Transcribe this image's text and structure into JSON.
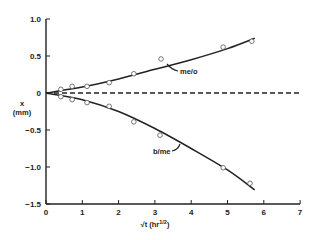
{
  "chart_data": {
    "type": "scatter",
    "title": "",
    "xlabel": "√t (hr^1/2)",
    "xlabel_main": "√t",
    "xlabel_unit": "(hr",
    "xlabel_exp": "1/2",
    "xlabel_close": ")",
    "ylabel": "x (mm)",
    "ylabel_var": "x",
    "ylabel_unit": "(mm)",
    "xlim": [
      0,
      7
    ],
    "ylim": [
      -1.5,
      1.0
    ],
    "x_ticks": [
      0,
      1,
      2,
      3,
      4,
      5,
      6,
      7
    ],
    "x_tick_labels": [
      "0",
      "1",
      "2",
      "3",
      "4",
      "5",
      "6",
      "7"
    ],
    "y_ticks": [
      1.0,
      0.5,
      0,
      -0.5,
      -1.0,
      -1.5
    ],
    "y_tick_labels": [
      "1.0",
      "0.5",
      "0",
      "−0.5",
      "−1.0",
      "−1.5"
    ],
    "grid": false,
    "legend": "none (inline annotations)",
    "series": [
      {
        "name": "me/o",
        "marker": "open circle",
        "x": [
          0.41,
          0.72,
          1.13,
          1.74,
          2.42,
          3.17,
          4.88,
          5.67
        ],
        "y": [
          0.05,
          0.09,
          0.09,
          0.14,
          0.26,
          0.46,
          0.62,
          0.7
        ],
        "fit_line": "solid",
        "fit_x": [
          0,
          1,
          2,
          3,
          4,
          5,
          5.75
        ],
        "fit_y": [
          0,
          0.08,
          0.19,
          0.32,
          0.45,
          0.6,
          0.74
        ]
      },
      {
        "name": "b/me",
        "marker": "open circle",
        "x": [
          0.41,
          0.72,
          1.13,
          1.74,
          2.42,
          3.14,
          4.88,
          5.62
        ],
        "y": [
          -0.05,
          -0.09,
          -0.13,
          -0.18,
          -0.39,
          -0.57,
          -1.01,
          -1.22
        ],
        "fit_line": "solid",
        "fit_x": [
          0,
          1,
          2,
          3,
          4,
          5,
          5.75
        ],
        "fit_y": [
          0,
          -0.09,
          -0.25,
          -0.48,
          -0.75,
          -1.04,
          -1.31
        ]
      },
      {
        "name": "interface (x = 0)",
        "line": "dashed",
        "x": [
          0,
          7
        ],
        "y": [
          0,
          0
        ]
      }
    ],
    "annotations": [
      {
        "text": "me/o",
        "x": 3.9,
        "y": 0.28
      },
      {
        "text": "b/me",
        "x": 3.0,
        "y": -0.78
      }
    ]
  }
}
